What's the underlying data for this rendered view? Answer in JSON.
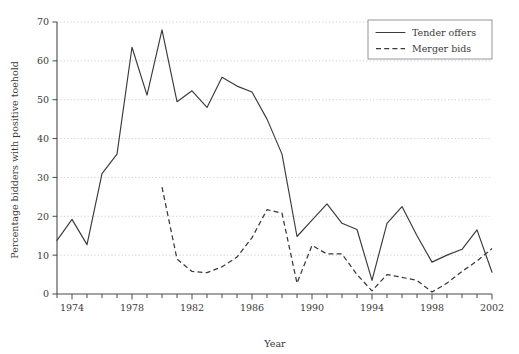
{
  "chart_data": {
    "type": "line",
    "title": "",
    "xlabel": "Year",
    "ylabel": "Percentage bidders with positive toehold",
    "xlim": [
      1973,
      2002
    ],
    "ylim": [
      0,
      70
    ],
    "ytick_step": 10,
    "yticks": [
      0,
      10,
      20,
      30,
      40,
      50,
      60,
      70
    ],
    "ytick_labels": [
      "0",
      "10",
      "20",
      "30",
      "40",
      "50",
      "60",
      "70"
    ],
    "xticks": [
      1973,
      1974,
      1975,
      1976,
      1977,
      1978,
      1979,
      1980,
      1981,
      1982,
      1983,
      1984,
      1985,
      1986,
      1987,
      1988,
      1989,
      1990,
      1991,
      1992,
      1993,
      1994,
      1995,
      1996,
      1997,
      1998,
      1999,
      2000,
      2001,
      2002
    ],
    "xtick_labels_shown": [
      "1974",
      "1978",
      "1982",
      "1986",
      "1990",
      "1994",
      "1998",
      "2002"
    ],
    "xtick_label_years": [
      1974,
      1978,
      1982,
      1986,
      1990,
      1994,
      1998,
      2002
    ],
    "grid": "horizontal-dotted",
    "legend_position": "top-right",
    "series": [
      {
        "name": "Tender offers",
        "style": "solid",
        "color": "#3a3a3a",
        "x": [
          1973,
          1974,
          1975,
          1976,
          1977,
          1978,
          1979,
          1980,
          1981,
          1982,
          1983,
          1984,
          1985,
          1986,
          1987,
          1988,
          1989,
          1990,
          1991,
          1992,
          1993,
          1994,
          1995,
          1996,
          1997,
          1998,
          1999,
          2000,
          2001,
          2002
        ],
        "values": [
          13.8,
          19.2,
          12.7,
          31.0,
          36.0,
          63.5,
          51.2,
          68.0,
          49.5,
          52.3,
          48.0,
          55.8,
          53.5,
          52.0,
          45.0,
          36.0,
          14.8,
          19.0,
          23.2,
          18.2,
          16.6,
          3.5,
          18.2,
          22.5,
          15.0,
          8.2,
          10.0,
          11.5,
          16.5,
          5.6
        ]
      },
      {
        "name": "Merger bids",
        "style": "dashed",
        "color": "#3a3a3a",
        "x": [
          1980,
          1981,
          1982,
          1983,
          1984,
          1985,
          1986,
          1987,
          1988,
          1989,
          1990,
          1991,
          1992,
          1993,
          1994,
          1995,
          1996,
          1997,
          1998,
          1999,
          2000,
          2001,
          2002
        ],
        "values": [
          27.5,
          9.0,
          5.8,
          5.5,
          7.0,
          9.5,
          14.5,
          21.7,
          20.8,
          2.8,
          12.5,
          10.3,
          10.3,
          5.0,
          0.8,
          5.0,
          4.3,
          3.5,
          0.5,
          2.8,
          5.8,
          8.5,
          11.7
        ]
      }
    ]
  },
  "legend": {
    "entries": [
      {
        "label": "Tender offers",
        "style": "solid"
      },
      {
        "label": "Merger bids",
        "style": "dashed"
      }
    ]
  },
  "axes": {
    "x_title": "Year",
    "y_title": "Percentage bidders with positive toehold"
  }
}
